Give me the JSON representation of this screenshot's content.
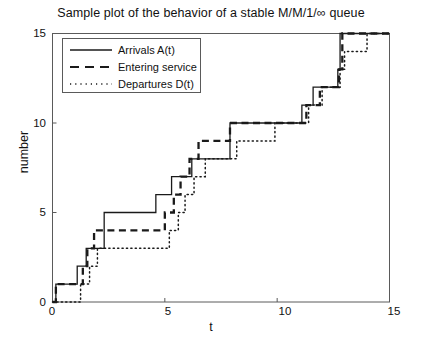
{
  "chart_data": {
    "type": "line",
    "title": "Sample plot of the behavior of a stable M/M/1/∞ queue",
    "xlabel": "t",
    "ylabel": "number",
    "xlim": [
      0,
      15
    ],
    "ylim": [
      0,
      15
    ],
    "xticks": [
      0,
      5,
      10,
      15
    ],
    "yticks": [
      0,
      5,
      10,
      15
    ],
    "grid": false,
    "legend_position": "upper-left",
    "series": [
      {
        "name": "Arrivals A(t)",
        "style": "solid",
        "color": "#1a1a1a",
        "step": "post",
        "x": [
          0,
          0.15,
          0.85,
          1.1,
          1.5,
          2.0,
          2.3,
          4.2,
          4.6,
          5.3,
          6.2,
          7.9,
          9.7,
          11.1,
          11.6,
          12.7,
          12.8,
          15
        ],
        "y": [
          0,
          1,
          1,
          2,
          3,
          3,
          5,
          5,
          6,
          7,
          8,
          10,
          10,
          11,
          12,
          13,
          15,
          15
        ]
      },
      {
        "name": "Entering service",
        "style": "dashed",
        "color": "#1a1a1a",
        "step": "post",
        "x": [
          0,
          0.15,
          1.1,
          1.35,
          1.55,
          1.85,
          4.5,
          5.0,
          5.4,
          5.7,
          6.1,
          6.5,
          7.9,
          9.7,
          11.3,
          11.9,
          12.75,
          12.9,
          15
        ],
        "y": [
          0,
          1,
          1,
          2,
          3,
          4,
          4,
          5,
          6,
          7,
          8,
          9,
          10,
          10,
          11,
          12,
          13,
          15,
          15
        ]
      },
      {
        "name": "Departures D(t)",
        "style": "dotted",
        "color": "#1a1a1a",
        "step": "post",
        "x": [
          0,
          1.15,
          1.25,
          1.65,
          2.0,
          4.8,
          5.2,
          5.6,
          5.9,
          6.3,
          6.8,
          8.2,
          9.9,
          11.4,
          12.0,
          12.8,
          13.0,
          13.6,
          14.0,
          15
        ],
        "y": [
          0,
          0,
          1,
          2,
          3,
          3,
          4,
          5,
          6,
          7,
          8,
          9,
          10,
          11,
          12,
          13,
          14,
          14,
          15,
          15
        ]
      }
    ]
  },
  "legend": {
    "entries": [
      {
        "label": "Arrivals A(t)",
        "style": "solid"
      },
      {
        "label": "Entering service",
        "style": "dashed"
      },
      {
        "label": "Departures D(t)",
        "style": "dotted"
      }
    ]
  },
  "axes": {
    "xtick_labels": [
      "0",
      "5",
      "10",
      "15"
    ],
    "ytick_labels": [
      "0",
      "5",
      "10",
      "15"
    ]
  }
}
